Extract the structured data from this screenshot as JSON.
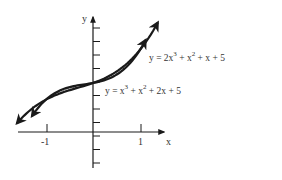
{
  "chart_data": {
    "type": "line",
    "title": "",
    "xlabel": "x",
    "ylabel": "y",
    "x_ticks": [
      {
        "value": -1,
        "label": "-1"
      },
      {
        "value": 1,
        "label": "1"
      }
    ],
    "series": [
      {
        "name": "y = 2x^3 + x^2 + x + 5",
        "label_text": {
          "base": "y = 2x",
          "exp1": "3",
          "mid": " + x",
          "exp2": "2",
          "tail": " + x + 5"
        },
        "coefficients": [
          2,
          1,
          1,
          5
        ],
        "x": [
          -1.35,
          -1,
          -0.5,
          0,
          0.5,
          1,
          1.1
        ],
        "values": [
          -0.44,
          3,
          4.5,
          5,
          6.0,
          9,
          10.97
        ]
      },
      {
        "name": "y = x^3 + x^2 + 2x + 5",
        "label_text": {
          "base": "y = x",
          "exp1": "3",
          "mid": " + x",
          "exp2": "2",
          "tail": " + 2x + 5"
        },
        "coefficients": [
          1,
          1,
          2,
          5
        ],
        "x": [
          -1.5,
          -1,
          -0.5,
          0,
          0.5,
          1,
          1.35
        ],
        "values": [
          0.88,
          3,
          3.88,
          5,
          6.38,
          9,
          11.9
        ]
      }
    ],
    "intersections": [
      {
        "x": -1,
        "y": 3
      },
      {
        "x": 0,
        "y": 5
      },
      {
        "x": 1,
        "y": 9
      }
    ],
    "shaded_regions": [
      {
        "from_x": -1,
        "to_x": 0,
        "description": "region between curves"
      },
      {
        "from_x": 0,
        "to_x": 1,
        "description": "region between curves"
      }
    ],
    "grid": false,
    "legend": "inline labels"
  },
  "axes": {
    "x_label": "x",
    "y_label": "y",
    "tick_neg1": "-1",
    "tick_pos1": "1"
  },
  "labels": {
    "curve1": {
      "base": "y = 2x",
      "exp1": "3",
      "mid": " + x",
      "exp2": "2",
      "tail": " + x + 5"
    },
    "curve2": {
      "base": "y = x",
      "exp1": "3",
      "mid": " + x",
      "exp2": "2",
      "tail": " + 2x + 5"
    }
  },
  "colors": {
    "ink": "#1a1a1a",
    "shade": "#b8b8b8"
  }
}
